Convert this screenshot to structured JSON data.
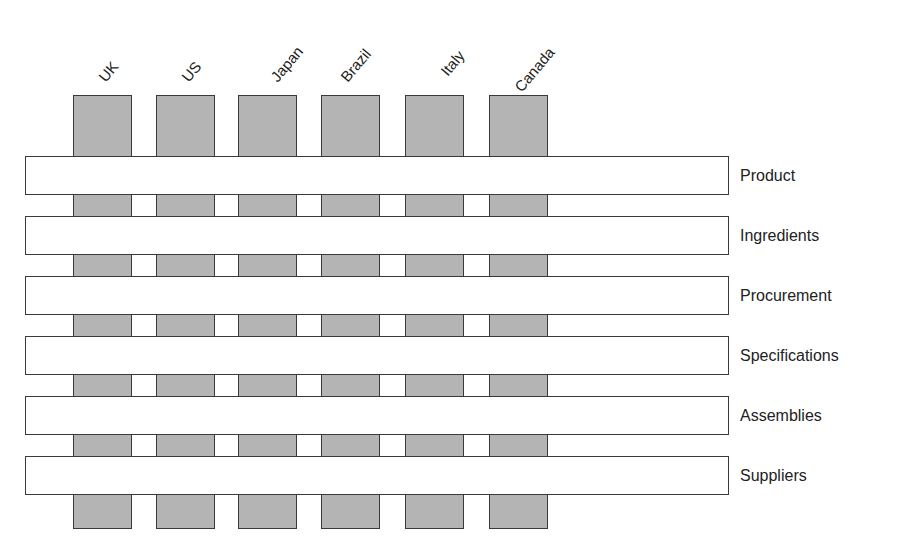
{
  "diagram": {
    "type": "matrix-weave",
    "columns": [
      {
        "label": "UK",
        "left": 73
      },
      {
        "label": "US",
        "left": 156
      },
      {
        "label": "Japan",
        "left": 238
      },
      {
        "label": "Brazil",
        "left": 321
      },
      {
        "label": "Italy",
        "left": 405
      },
      {
        "label": "Canada",
        "left": 489
      }
    ],
    "rows": [
      {
        "label": "Product",
        "top": 156
      },
      {
        "label": "Ingredients",
        "top": 216
      },
      {
        "label": "Procurement",
        "top": 276
      },
      {
        "label": "Specifications",
        "top": 336
      },
      {
        "label": "Assemblies",
        "top": 396
      },
      {
        "label": "Suppliers",
        "top": 456
      }
    ],
    "colors": {
      "column_fill": "#b4b4b4",
      "row_fill": "#ffffff",
      "border": "#3a3a3a",
      "text": "#222222"
    }
  }
}
